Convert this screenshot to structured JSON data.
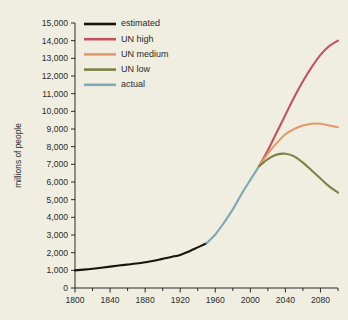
{
  "figure": {
    "background_color": "#efeee1",
    "cropped_title_fragment": ""
  },
  "axes": {
    "x_title": "",
    "y_title": "millions of people",
    "x_ticks_major": [
      "1800",
      "1840",
      "1880",
      "1920",
      "1960",
      "2000",
      "2040",
      "2080"
    ],
    "x_tick_values_major": [
      1800,
      1840,
      1880,
      1920,
      1960,
      2000,
      2040,
      2080
    ],
    "x_tick_values_minor": [
      1820,
      1860,
      1900,
      1940,
      1980,
      2020,
      2060,
      2100
    ],
    "y_ticks": [
      "0",
      "1,000",
      "2,000",
      "3,000",
      "4,000",
      "5,000",
      "6,000",
      "7,000",
      "8,000",
      "9,000",
      "10,000",
      "11,000",
      "12,000",
      "13,000",
      "14,000",
      "15,000"
    ],
    "y_tick_values": [
      0,
      1000,
      2000,
      3000,
      4000,
      5000,
      6000,
      7000,
      8000,
      9000,
      10000,
      11000,
      12000,
      13000,
      14000,
      15000
    ],
    "xlim": [
      1800,
      2100
    ],
    "ylim": [
      0,
      15000
    ],
    "grid": "off",
    "axis_color": "#2b2b28"
  },
  "legend": {
    "position": "top-left-inside",
    "items": [
      {
        "label": "estimated",
        "color": "#15150f"
      },
      {
        "label": "UN high",
        "color": "#c4515c"
      },
      {
        "label": "UN medium",
        "color": "#e39a6b"
      },
      {
        "label": "UN low",
        "color": "#7d8244"
      },
      {
        "label": "actual",
        "color": "#7fa8b5"
      }
    ]
  },
  "chart_data": {
    "type": "line",
    "title": "",
    "xlabel": "",
    "ylabel": "millions of people",
    "xlim": [
      1800,
      2100
    ],
    "ylim": [
      0,
      15000
    ],
    "grid": false,
    "legend_position": "top-left-inside",
    "x_tick_labels": [
      "1800",
      "1840",
      "1880",
      "1920",
      "1960",
      "2000",
      "2040",
      "2080"
    ],
    "y_tick_labels": [
      "0",
      "1,000",
      "2,000",
      "3,000",
      "4,000",
      "5,000",
      "6,000",
      "7,000",
      "8,000",
      "9,000",
      "10,000",
      "11,000",
      "12,000",
      "13,000",
      "14,000",
      "15,000"
    ],
    "series": [
      {
        "name": "estimated",
        "color": "#15150f",
        "x": [
          1800,
          1810,
          1820,
          1830,
          1840,
          1850,
          1860,
          1870,
          1880,
          1890,
          1900,
          1910,
          1920,
          1930,
          1940,
          1950
        ],
        "values": [
          1000,
          1040,
          1090,
          1150,
          1210,
          1270,
          1330,
          1390,
          1460,
          1540,
          1650,
          1760,
          1870,
          2070,
          2300,
          2530
        ]
      },
      {
        "name": "actual",
        "color": "#7fa8b5",
        "x": [
          1950,
          1960,
          1970,
          1980,
          1990,
          2000,
          2010
        ],
        "values": [
          2530,
          3030,
          3700,
          4450,
          5320,
          6120,
          6900
        ]
      },
      {
        "name": "UN high",
        "color": "#c4515c",
        "x": [
          2010,
          2020,
          2030,
          2040,
          2050,
          2060,
          2070,
          2080,
          2090,
          2100
        ],
        "values": [
          6900,
          7800,
          8800,
          9800,
          10800,
          11700,
          12500,
          13200,
          13700,
          14000
        ]
      },
      {
        "name": "UN medium",
        "color": "#e39a6b",
        "x": [
          2010,
          2020,
          2030,
          2040,
          2050,
          2060,
          2070,
          2080,
          2090,
          2100
        ],
        "values": [
          6900,
          7600,
          8200,
          8700,
          9000,
          9200,
          9300,
          9300,
          9200,
          9100
        ]
      },
      {
        "name": "UN low",
        "color": "#7d8244",
        "x": [
          2010,
          2020,
          2030,
          2040,
          2050,
          2060,
          2070,
          2080,
          2090,
          2100
        ],
        "values": [
          6900,
          7300,
          7550,
          7600,
          7450,
          7100,
          6650,
          6200,
          5750,
          5400
        ]
      }
    ]
  }
}
